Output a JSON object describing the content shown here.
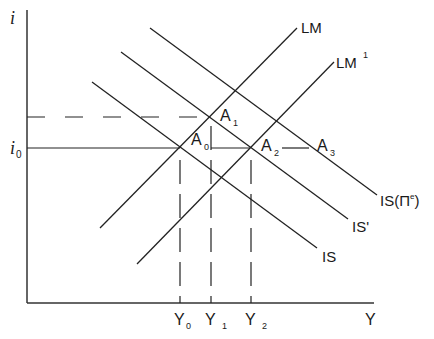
{
  "diagram": {
    "axes": {
      "y_label": "i",
      "x_label": "Y",
      "y_ticks": [
        {
          "label": "i",
          "sub": "0"
        }
      ],
      "x_ticks": [
        {
          "label": "Y",
          "sub": "0"
        },
        {
          "label": "Y",
          "sub": "1"
        },
        {
          "label": "Y",
          "sub": "2"
        }
      ]
    },
    "curves": {
      "lm": {
        "label": "LM",
        "sup": ""
      },
      "lm1": {
        "label": "LM",
        "sup": "1"
      },
      "is": {
        "label": "IS"
      },
      "is_prime": {
        "label": "IS'"
      },
      "is_pe": {
        "label": "IS(Π",
        "sup": "e",
        "close": ")"
      }
    },
    "points": {
      "a0": {
        "label": "A",
        "sub": "0"
      },
      "a1": {
        "label": "A",
        "sub": "1"
      },
      "a2": {
        "label": "A",
        "sub": "2"
      },
      "a3": {
        "label": "A",
        "sub": "3"
      }
    },
    "colors": {
      "line": "#1a1a1a",
      "background": "#ffffff"
    }
  }
}
